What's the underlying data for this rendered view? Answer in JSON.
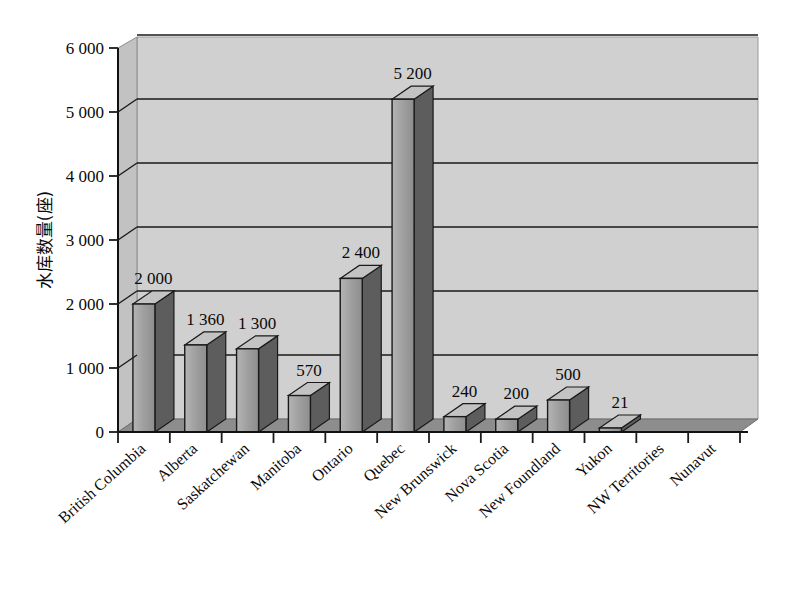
{
  "chart_data": {
    "type": "bar",
    "title": "",
    "subtitle": "",
    "xlabel": "",
    "ylabel": "水库数量(座)",
    "ylim": [
      0,
      6000
    ],
    "ytick_step": 1000,
    "ytick_labels": [
      "0",
      "1 000",
      "2 000",
      "3 000",
      "4 000",
      "5 000",
      "6 000"
    ],
    "ytick_values": [
      0,
      1000,
      2000,
      3000,
      4000,
      5000,
      6000
    ],
    "grid": true,
    "grid_axis": "y",
    "legend": false,
    "legend_position": "none",
    "three_d": true,
    "categories": [
      "British Columbia",
      "Alberta",
      "Saskatchewan",
      "Manitoba",
      "Ontario",
      "Quebec",
      "New Brunswick",
      "Nova Scotia",
      "New Foundland",
      "Yukon",
      "NW Territories",
      "Nunavut"
    ],
    "values": [
      2000,
      1360,
      1300,
      570,
      2400,
      5200,
      240,
      200,
      500,
      21,
      0,
      0
    ],
    "value_labels": [
      "2 000",
      "1 360",
      "1 300",
      "570",
      "2 400",
      "5 200",
      "240",
      "200",
      "500",
      "21",
      "",
      ""
    ],
    "colors": {
      "bar_front": "#9a9a9a",
      "bar_side": "#5d5d5d",
      "bar_top": "#c3c3c3",
      "bar_outline": "#1a1a1a",
      "wall_back": "#cfcfcf",
      "wall_side": "#bdbdbd",
      "floor": "#8f8f8f",
      "gridline": "#1a1a1a",
      "axis": "#1a1a1a",
      "text": "#0a0a0a",
      "background": "#ffffff"
    }
  }
}
